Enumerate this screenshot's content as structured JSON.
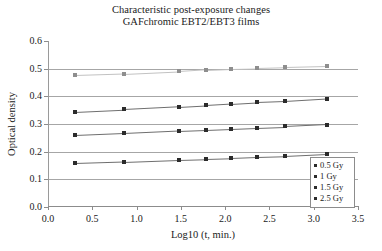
{
  "chart_data": {
    "type": "line",
    "title": "Characteristic post-exposure changes",
    "subtitle": "GAFchromic EBT2/EBT3 films",
    "xlabel": "Log10 (t, min.)",
    "ylabel": "Optical density",
    "xlim": [
      0.0,
      3.5
    ],
    "ylim": [
      0.0,
      0.6
    ],
    "xticks": [
      "0.0",
      "0.5",
      "1.0",
      "1.5",
      "2.0",
      "2.5",
      "3.0",
      "3.5"
    ],
    "xtick_values": [
      0.0,
      0.5,
      1.0,
      1.5,
      2.0,
      2.5,
      3.0,
      3.5
    ],
    "yticks": [
      "0.0",
      "0.1",
      "0.2",
      "0.3",
      "0.4",
      "0.5",
      "0.6"
    ],
    "ytick_values": [
      0.0,
      0.1,
      0.2,
      0.3,
      0.4,
      0.5,
      0.6
    ],
    "grid": "horizontal",
    "legend_position": "bottom-right-inside",
    "marker": "square",
    "x": [
      0.31,
      0.86,
      1.48,
      1.78,
      2.07,
      2.36,
      2.68,
      3.15
    ],
    "series": [
      {
        "name": "0.5 Gy",
        "color": "#2b2b2b",
        "values": [
          0.158,
          0.163,
          0.17,
          0.173,
          0.176,
          0.18,
          0.183,
          0.19
        ]
      },
      {
        "name": "1 Gy",
        "color": "#2b2b2b",
        "values": [
          0.259,
          0.266,
          0.275,
          0.279,
          0.283,
          0.287,
          0.291,
          0.298
        ]
      },
      {
        "name": "1.5 Gy",
        "color": "#2b2b2b",
        "values": [
          0.345,
          0.353,
          0.363,
          0.368,
          0.373,
          0.378,
          0.382,
          0.391
        ]
      },
      {
        "name": "2.5 Gy",
        "color": "#8e8e8e",
        "values": [
          0.476,
          0.481,
          0.49,
          0.496,
          0.5,
          0.502,
          0.505,
          0.509
        ]
      }
    ]
  },
  "legend": {
    "items": [
      "0.5 Gy",
      "1 Gy",
      "1.5 Gy",
      "2.5 Gy"
    ]
  }
}
